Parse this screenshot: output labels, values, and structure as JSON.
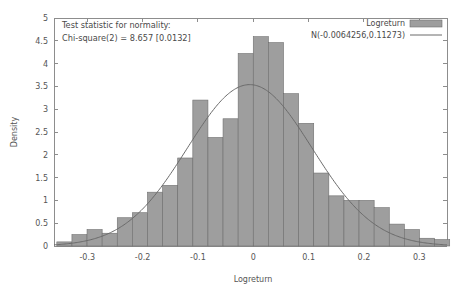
{
  "chart_data": {
    "type": "bar",
    "title": "",
    "xlabel": "Logreturn",
    "ylabel": "Density",
    "xlim": [
      -0.36,
      0.35
    ],
    "ylim": [
      0,
      5
    ],
    "grid": false,
    "legend_position": "top-right",
    "xticks": [
      -0.3,
      -0.2,
      -0.1,
      0,
      0.1,
      0.2,
      0.3
    ],
    "xtick_labels": [
      "-0.3",
      "-0.2",
      "-0.1",
      "0",
      "0.1",
      "0.2",
      "0.3"
    ],
    "yticks": [
      0,
      0.5,
      1,
      1.5,
      2,
      2.5,
      3,
      3.5,
      4,
      4.5,
      5
    ],
    "ytick_labels": [
      "0",
      "0.5",
      "1",
      "1.5",
      "2",
      "2.5",
      "3",
      "3.5",
      "4",
      "4.5",
      "5"
    ],
    "bin_width": 0.0273,
    "bin_left_edges": [
      -0.3549,
      -0.3276,
      -0.3003,
      -0.273,
      -0.2457,
      -0.2184,
      -0.1911,
      -0.1638,
      -0.1365,
      -0.1092,
      -0.0819,
      -0.0546,
      -0.0273,
      0.0,
      0.0273,
      0.0546,
      0.0819,
      0.1092,
      0.1365,
      0.1638,
      0.1911,
      0.2184,
      0.2457,
      0.273,
      0.3003,
      0.3276
    ],
    "bin_centers": [
      -0.3413,
      -0.314,
      -0.2867,
      -0.2594,
      -0.2321,
      -0.2048,
      -0.1775,
      -0.1502,
      -0.1229,
      -0.0956,
      -0.0683,
      -0.041,
      -0.0137,
      0.0137,
      0.041,
      0.0683,
      0.0956,
      0.1229,
      0.1502,
      0.1775,
      0.2048,
      0.2321,
      0.2594,
      0.2867,
      0.314,
      0.3413
    ],
    "values": [
      0.09,
      0.25,
      0.36,
      0.28,
      0.62,
      0.73,
      1.18,
      1.33,
      1.93,
      3.2,
      2.38,
      2.79,
      4.22,
      4.59,
      4.46,
      3.34,
      2.69,
      1.6,
      1.1,
      1.0,
      1.0,
      0.84,
      0.48,
      0.36,
      0.17,
      0.14
    ],
    "series": [
      {
        "name": "Logreturn",
        "kind": "histogram",
        "color": "#9e9e9e",
        "values": [
          0.09,
          0.25,
          0.36,
          0.28,
          0.62,
          0.73,
          1.18,
          1.33,
          1.93,
          3.2,
          2.38,
          2.79,
          4.22,
          4.59,
          4.46,
          3.34,
          2.69,
          1.6,
          1.1,
          1.0,
          1.0,
          0.84,
          0.48,
          0.36,
          0.17,
          0.14
        ]
      },
      {
        "name": "N(-0.0064256,0.11273)",
        "kind": "normal-pdf",
        "color": "#6a6a6a",
        "mu": -0.0064256,
        "sigma": 0.11273,
        "peak": 3.5386
      }
    ],
    "annotations": [
      "Test statistic for normality:",
      "Chi-square(2) = 8.657 [0.0132]"
    ]
  },
  "chart": {
    "xlabel": "Logreturn",
    "ylabel": "Density",
    "annotation_line_1": "Test statistic for normality:",
    "annotation_line_2": "Chi-square(2) = 8.657 [0.0132]",
    "legend": {
      "histogram_label": "Logreturn",
      "curve_label": "N(-0.0064256,0.11273)"
    },
    "colors": {
      "bar_fill": "#9e9e9e",
      "bar_stroke": "#6e6e6e",
      "curve": "#6a6a6a",
      "axis": "#8d8d8d",
      "text": "#4a4a4a",
      "background": "#ffffff"
    }
  }
}
